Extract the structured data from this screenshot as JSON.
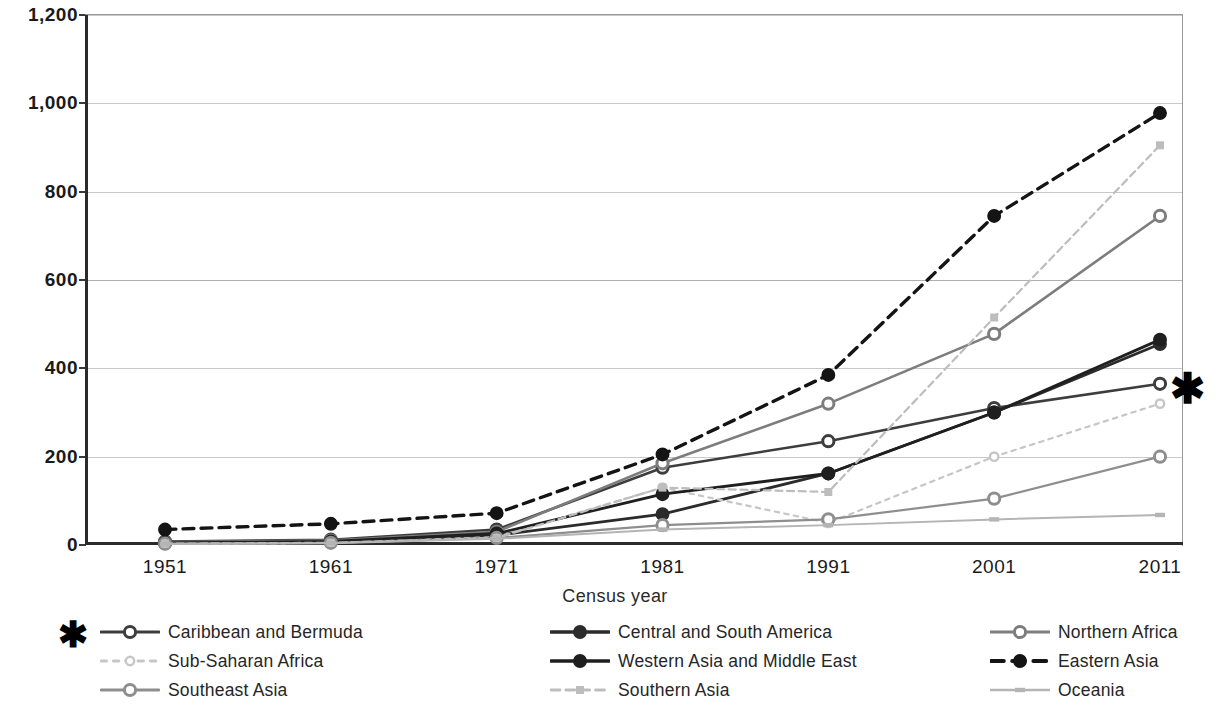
{
  "chart_data": {
    "type": "line",
    "title": "",
    "xlabel": "Census year",
    "ylabel": "",
    "categories": [
      "1951",
      "1961",
      "1971",
      "1981",
      "1991",
      "2001",
      "2011"
    ],
    "x": [
      1951,
      1961,
      1971,
      1981,
      1991,
      2001,
      2011
    ],
    "ylim": [
      0,
      1200
    ],
    "yticks": [
      "0",
      "200",
      "400",
      "600",
      "800",
      "1,000",
      "1,200"
    ],
    "ytick_values": [
      0,
      200,
      400,
      600,
      800,
      1000,
      1200
    ],
    "grid": "horizontal",
    "legend_position": "bottom",
    "legend_columns": 3,
    "annotations": [
      {
        "name": "plot-asterisk",
        "symbol": "*",
        "near": "Caribbean and Bermuda 2011 endpoint"
      },
      {
        "name": "legend-asterisk",
        "symbol": "*",
        "near": "Caribbean and Bermuda legend entry"
      }
    ],
    "series": [
      {
        "name": "Caribbean and Bermuda",
        "values": [
          8,
          12,
          35,
          175,
          235,
          310,
          365
        ],
        "color": "#3d3d3d",
        "dash": "solid",
        "marker": "open-circle",
        "width": 2.6
      },
      {
        "name": "Central and South America",
        "values": [
          4,
          6,
          22,
          70,
          162,
          300,
          455
        ],
        "color": "#2b2b2b",
        "dash": "solid",
        "marker": "filled-circle",
        "width": 2.8
      },
      {
        "name": "Northern Africa",
        "values": [
          6,
          10,
          30,
          185,
          320,
          478,
          745
        ],
        "color": "#7d7d7d",
        "dash": "solid",
        "marker": "open-circle",
        "width": 2.6
      },
      {
        "name": "Sub-Saharan Africa",
        "values": [
          3,
          5,
          18,
          130,
          50,
          200,
          320
        ],
        "color": "#c6c6c6",
        "dash": "dotted",
        "marker": "small-open",
        "width": 2.2
      },
      {
        "name": "Western Asia and Middle East",
        "values": [
          5,
          8,
          26,
          115,
          162,
          300,
          465
        ],
        "color": "#1f1f1f",
        "dash": "solid",
        "marker": "filled-circle",
        "width": 2.8
      },
      {
        "name": "Eastern Asia",
        "values": [
          35,
          48,
          72,
          205,
          385,
          745,
          978
        ],
        "color": "#141414",
        "dash": "dashed",
        "marker": "filled-circle",
        "width": 3.4
      },
      {
        "name": "Southeast Asia",
        "values": [
          3,
          5,
          16,
          45,
          58,
          105,
          200
        ],
        "color": "#8e8e8e",
        "dash": "solid",
        "marker": "open-circle",
        "width": 2.2
      },
      {
        "name": "Southern Asia",
        "values": [
          3,
          5,
          16,
          130,
          120,
          515,
          905
        ],
        "color": "#bdbdbd",
        "dash": "dashed",
        "marker": "small-square",
        "width": 2.2
      },
      {
        "name": "Oceania",
        "values": [
          2,
          4,
          14,
          35,
          45,
          58,
          68
        ],
        "color": "#b4b4b4",
        "dash": "solid",
        "marker": "small-dash",
        "width": 2.0
      }
    ]
  },
  "legend": {
    "rows": [
      [
        {
          "label": "Caribbean and Bermuda",
          "series_index": 0
        },
        {
          "label": "Central and South America",
          "series_index": 1
        },
        {
          "label": "Northern Africa",
          "series_index": 2
        }
      ],
      [
        {
          "label": "Sub-Saharan Africa",
          "series_index": 3
        },
        {
          "label": "Western Asia and Middle East",
          "series_index": 4
        },
        {
          "label": "Eastern Asia",
          "series_index": 5
        }
      ],
      [
        {
          "label": "Southeast Asia",
          "series_index": 6
        },
        {
          "label": "Southern Asia",
          "series_index": 7
        },
        {
          "label": "Oceania",
          "series_index": 8
        }
      ]
    ]
  },
  "marks": {
    "asterisk": "✱"
  }
}
